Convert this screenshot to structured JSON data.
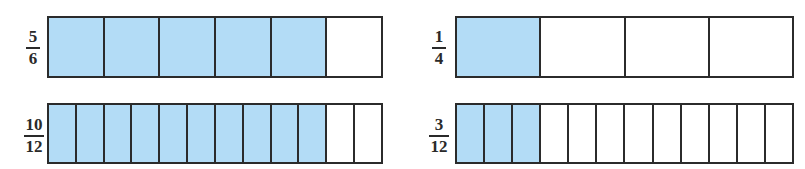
{
  "colors": {
    "shaded": "#b3dcf6",
    "unshaded": "#ffffff",
    "border": "#2b2b2b"
  },
  "diagrams": [
    {
      "numerator": "5",
      "denominator": "6",
      "parts": 6,
      "shaded": 5
    },
    {
      "numerator": "1",
      "denominator": "4",
      "parts": 4,
      "shaded": 1
    },
    {
      "numerator": "10",
      "denominator": "12",
      "parts": 12,
      "shaded": 10
    },
    {
      "numerator": "3",
      "denominator": "12",
      "parts": 12,
      "shaded": 3
    }
  ]
}
